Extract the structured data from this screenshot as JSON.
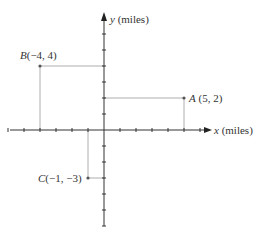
{
  "diagram": {
    "type": "coordinate-plane",
    "x_axis_label_var": "x",
    "x_axis_label_unit": " (miles)",
    "y_axis_label_var": "y",
    "y_axis_label_unit": " (miles)",
    "origin_px": [
      104,
      130
    ],
    "unit_px": 16,
    "x_ticks": [
      -6,
      -5,
      -4,
      -3,
      -2,
      -1,
      1,
      2,
      3,
      4,
      5,
      6
    ],
    "y_ticks": [
      -6,
      -5,
      -4,
      -3,
      -2,
      -1,
      1,
      2,
      3,
      4,
      5,
      6,
      7
    ],
    "points": [
      {
        "name": "A",
        "x": 5,
        "y": 2,
        "label_name": "A",
        "label_coords": " (5, 2)"
      },
      {
        "name": "B",
        "x": -4,
        "y": 4,
        "label_name": "B",
        "label_coords": "(−4, 4)"
      },
      {
        "name": "C",
        "x": -1,
        "y": -3,
        "label_name": "C",
        "label_coords": "(−1, −3)"
      }
    ]
  },
  "colors": {
    "axis": "#333333",
    "guide": "#999999",
    "point": "#555555",
    "text": "#333333"
  }
}
